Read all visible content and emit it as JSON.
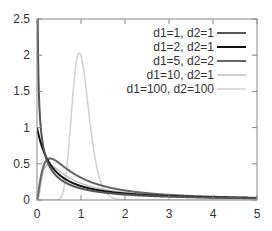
{
  "chart_data": {
    "type": "line",
    "title": "",
    "xlabel": "",
    "ylabel": "",
    "xlim": [
      0,
      5
    ],
    "ylim": [
      0,
      2.5
    ],
    "x_ticks": [
      "0",
      "1",
      "2",
      "3",
      "4",
      "5"
    ],
    "y_ticks": [
      "0",
      "0.5",
      "1",
      "1.5",
      "2",
      "2.5"
    ],
    "grid": false,
    "legend_position": "upper right",
    "distribution": "F-distribution probability density",
    "series": [
      {
        "name": "d1=1, d2=1",
        "d1": 1,
        "d2": 1,
        "color": "#555555",
        "width": 2
      },
      {
        "name": "d1=2, d2=1",
        "d1": 2,
        "d2": 1,
        "color": "#111111",
        "width": 2
      },
      {
        "name": "d1=5, d2=2",
        "d1": 5,
        "d2": 2,
        "color": "#666666",
        "width": 2
      },
      {
        "name": "d1=10, d2=1",
        "d1": 10,
        "d2": 1,
        "color": "#bdbdbd",
        "width": 1.5
      },
      {
        "name": "d1=100, d2=100",
        "d1": 100,
        "d2": 100,
        "color": "#d0d0d0",
        "width": 1.5
      }
    ],
    "sample_points": {
      "x": [
        0.25,
        0.5,
        1,
        2,
        3,
        5
      ],
      "d1=1, d2=1": [
        0.51,
        0.3,
        0.16,
        0.075,
        0.046,
        0.022
      ],
      "d1=2, d2=1": [
        0.57,
        0.38,
        0.19,
        0.076,
        0.041,
        0.017
      ],
      "d1=5, d2=2": [
        0.5,
        0.55,
        0.31,
        0.12,
        0.062,
        0.025
      ],
      "d1=10, d2=1": [
        0.19,
        0.33,
        0.25,
        0.1,
        0.054,
        0.022
      ],
      "d1=100, d2=100": [
        0.0,
        0.0,
        1.99,
        0.0,
        0.0,
        0.0
      ]
    }
  }
}
